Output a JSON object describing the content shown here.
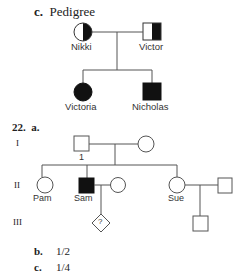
{
  "section_c": {
    "marker": "c.",
    "title": "Pedigree",
    "individuals": {
      "nikki": {
        "name": "Nikki",
        "sex": "female",
        "status": "carrier (half-filled)"
      },
      "victor": {
        "name": "Victor",
        "sex": "male",
        "status": "carrier (half-filled)"
      },
      "victoria": {
        "name": "Victoria",
        "sex": "female",
        "status": "affected"
      },
      "nicholas": {
        "name": "Nicholas",
        "sex": "male",
        "status": "affected"
      }
    }
  },
  "question_22": {
    "number": "22.",
    "part_a": "a.",
    "generations": [
      "I",
      "II",
      "III"
    ],
    "individuals": {
      "gen1_male_label": "1",
      "pam": {
        "name": "Pam",
        "sex": "female",
        "status": "unaffected"
      },
      "sam": {
        "name": "Sam",
        "sex": "male",
        "status": "affected"
      },
      "sue": {
        "name": "Sue",
        "sex": "female",
        "status": "unaffected"
      },
      "unknown_child": {
        "symbol": "?",
        "sex": "unknown"
      }
    },
    "part_b": {
      "marker": "b.",
      "answer": "1/2"
    },
    "part_c": {
      "marker": "c.",
      "answer": "1/4"
    }
  },
  "colors": {
    "line": "#555555",
    "fill": "#111111",
    "text": "#222222"
  }
}
